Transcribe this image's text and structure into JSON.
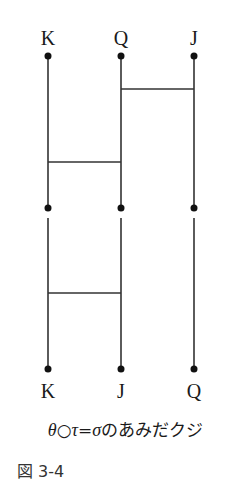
{
  "diagram": {
    "type": "amidakuji",
    "top_labels": [
      "K",
      "Q",
      "J"
    ],
    "bottom_labels": [
      "K",
      "J",
      "Q"
    ],
    "columns_x": [
      48,
      121,
      194
    ],
    "segments": [
      {
        "name": "theta",
        "y_top": 56,
        "y_bottom": 208,
        "rungs": [
          {
            "from_col": 1,
            "to_col": 2,
            "y": 89
          },
          {
            "from_col": 0,
            "to_col": 1,
            "y": 162
          }
        ]
      },
      {
        "name": "tau",
        "y_top": 218,
        "y_bottom": 369,
        "rungs": [
          {
            "from_col": 0,
            "to_col": 1,
            "y": 293
          }
        ]
      }
    ],
    "colors": {
      "line": "#333333",
      "dot": "#111111"
    }
  },
  "caption": {
    "theta": "θ",
    "circle": "○",
    "tau": "τ",
    "equals": "=",
    "sigma": "σ",
    "text": "のあみだクジ"
  },
  "figure_label": "図 3-4"
}
